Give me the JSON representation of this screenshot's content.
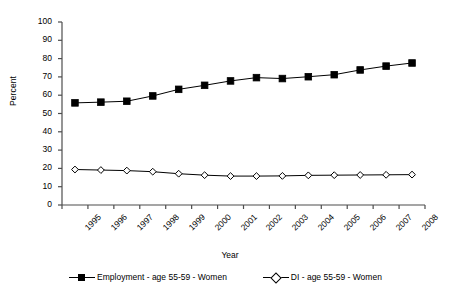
{
  "chart_data": {
    "type": "line",
    "title": "",
    "xlabel": "Year",
    "ylabel": "Percent",
    "ylim": [
      0,
      100
    ],
    "ytick_step": 10,
    "grid": false,
    "legend_position": "bottom",
    "categories": [
      "1995",
      "1996",
      "1997",
      "1998",
      "1999",
      "2000",
      "2001",
      "2002",
      "2003",
      "2004",
      "2005",
      "2006",
      "2007",
      "2008"
    ],
    "yticks": [
      "0",
      "10",
      "20",
      "30",
      "40",
      "50",
      "60",
      "70",
      "80",
      "90",
      "100"
    ],
    "series": [
      {
        "name": "Employment - age 55-59 - Women",
        "marker": "filled-square",
        "color": "#000000",
        "values": [
          55.8,
          56.2,
          56.7,
          59.6,
          63.2,
          65.4,
          67.8,
          69.6,
          69.1,
          70.1,
          71.2,
          73.8,
          75.9,
          77.6
        ]
      },
      {
        "name": "DI - age 55-59 - Women",
        "marker": "open-diamond",
        "color": "#000000",
        "values": [
          19.4,
          19.1,
          18.8,
          18.2,
          17.1,
          16.3,
          15.8,
          15.8,
          15.9,
          16.2,
          16.3,
          16.4,
          16.5,
          16.6
        ]
      }
    ]
  },
  "legend": {
    "entries": [
      {
        "label": "Employment - age 55-59 - Women"
      },
      {
        "label": "DI - age 55-59 - Women"
      }
    ]
  }
}
